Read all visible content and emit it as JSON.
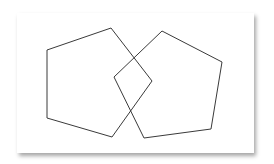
{
  "diagram": {
    "type": "overlapping-pentagons",
    "stroke_color": "#3a3a3a",
    "background": "#ffffff",
    "shapes": [
      {
        "name": "left-pentagon",
        "points": "111,28 152,81 112,137 47,118 47,50"
      },
      {
        "name": "right-pentagon",
        "points": "162,31 222,62 211,129 144,138 114,77"
      }
    ]
  }
}
